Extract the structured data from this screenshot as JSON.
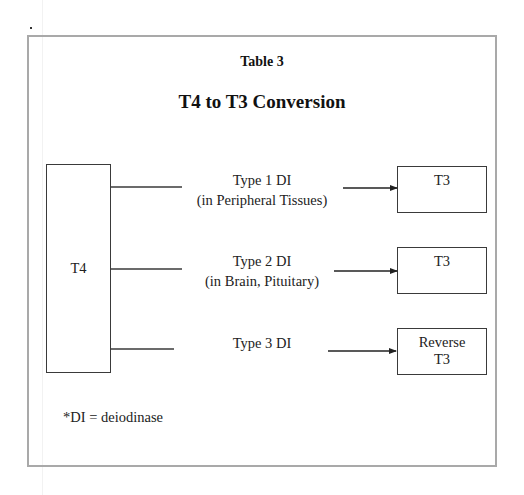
{
  "table_label": "Table 3",
  "title": "T4 to T3 Conversion",
  "source": {
    "label": "T4"
  },
  "pathways": [
    {
      "enzyme": "Type 1 DI",
      "location": "(in Peripheral Tissues)",
      "product_line1": "T3",
      "product_line2": ""
    },
    {
      "enzyme": "Type 2 DI",
      "location": "(in Brain, Pituitary)",
      "product_line1": "T3",
      "product_line2": ""
    },
    {
      "enzyme": "Type 3 DI",
      "location": "",
      "product_line1": "Reverse",
      "product_line2": "T3"
    }
  ],
  "footnote": "*DI = deiodinase",
  "colors": {
    "frame": "#a9a9a9",
    "line": "#3a3a3a",
    "text": "#222222"
  }
}
